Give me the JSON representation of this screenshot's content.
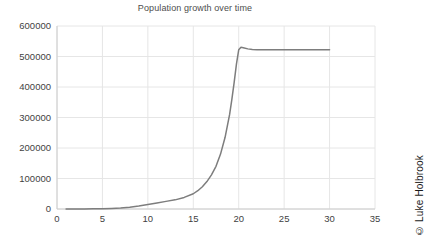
{
  "chart_data": {
    "type": "line",
    "title": "Population growth over time",
    "xlabel": "",
    "ylabel": "",
    "xlim": [
      0,
      35
    ],
    "ylim": [
      0,
      600000
    ],
    "grid": true,
    "legend": false,
    "xticks": [
      "0",
      "5",
      "10",
      "15",
      "20",
      "25",
      "30",
      "35"
    ],
    "xtick_values": [
      0,
      5,
      10,
      15,
      20,
      25,
      30,
      35
    ],
    "yticks": [
      "0",
      "100000",
      "200000",
      "300000",
      "400000",
      "500000",
      "600000"
    ],
    "ytick_values": [
      0,
      100000,
      200000,
      300000,
      400000,
      500000,
      600000
    ],
    "series": [
      {
        "name": "Population",
        "color": "#7d7d7d",
        "x": [
          1,
          2,
          3,
          4,
          5,
          6,
          7,
          8,
          9,
          10,
          11,
          12,
          13,
          14,
          15,
          15.5,
          16,
          16.5,
          17,
          17.5,
          18,
          18.5,
          19,
          19.25,
          19.5,
          19.75,
          20,
          20.25,
          20.5,
          21,
          21.5,
          22,
          23,
          24,
          25,
          26,
          27,
          28,
          29,
          30
        ],
        "values": [
          100,
          180,
          330,
          600,
          1100,
          2000,
          3500,
          6000,
          10000,
          15000,
          20000,
          25000,
          30000,
          38000,
          50000,
          60000,
          73000,
          90000,
          112000,
          140000,
          180000,
          235000,
          310000,
          360000,
          415000,
          475000,
          522000,
          530000,
          529000,
          525000,
          523000,
          522500,
          522000,
          522000,
          522000,
          522000,
          522000,
          522000,
          522000,
          522000
        ]
      }
    ],
    "annotations": {
      "peak_value": 530000,
      "plateau_value": 522000,
      "curve_shape": "logistic"
    }
  },
  "watermark": {
    "text": "© Luke Holbrook"
  },
  "colors": {
    "line": "#7d7d7d",
    "grid": "#e6e6e6",
    "axis": "#cccccc",
    "text": "#3f3f3f",
    "title": "#4d4d4d",
    "background": "#ffffff"
  }
}
